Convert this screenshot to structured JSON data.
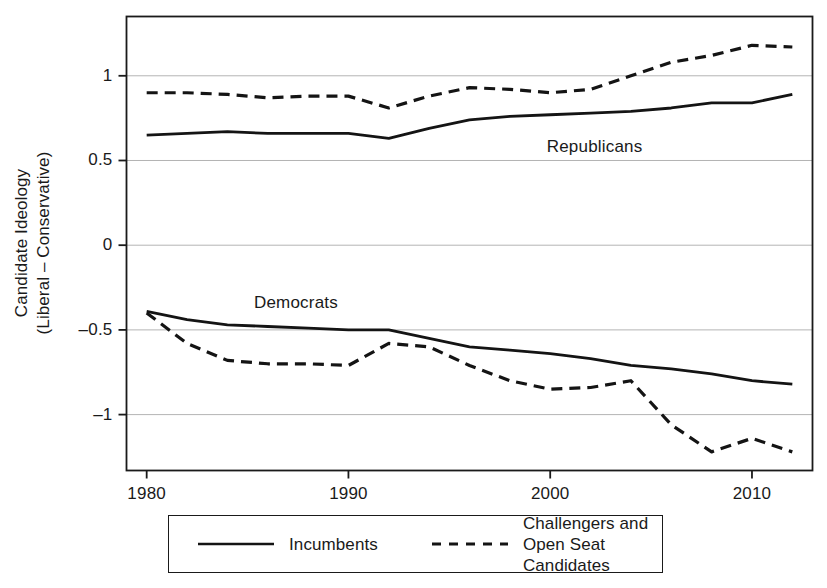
{
  "chart_data": {
    "type": "line",
    "title": "",
    "xlabel": "",
    "ylabel": "Candidate Ideology\n(Liberal – Conservative)",
    "ylabel_line1": "Candidate Ideology",
    "ylabel_line2": "(Liberal – Conservative)",
    "xlim": [
      1979,
      2013
    ],
    "ylim": [
      -1.33,
      1.35
    ],
    "grid": true,
    "grid_axis": "y",
    "legend_position": "below-plot",
    "x": [
      1980,
      1982,
      1984,
      1986,
      1988,
      1990,
      1992,
      1994,
      1996,
      1998,
      2000,
      2002,
      2004,
      2006,
      2008,
      2010,
      2012
    ],
    "xticks": [
      1980,
      1990,
      2000,
      2010
    ],
    "xtick_labels": [
      "1980",
      "1990",
      "2000",
      "2010"
    ],
    "yticks": [
      1,
      0.5,
      0,
      -0.5,
      -1
    ],
    "ytick_labels": [
      "1",
      "0.5",
      "0",
      "-0.5",
      "-1"
    ],
    "annotations": [
      {
        "text": "Republicans",
        "x": 2002.2,
        "y": 0.58
      },
      {
        "text": "Democrats",
        "x": 1987.4,
        "y": -0.34
      }
    ],
    "series": [
      {
        "name": "Republican Incumbents",
        "party": "Republicans",
        "type": "Incumbents",
        "style": "solid",
        "color": "#141414",
        "values": [
          0.65,
          0.66,
          0.67,
          0.66,
          0.66,
          0.66,
          0.63,
          0.69,
          0.74,
          0.76,
          0.77,
          0.78,
          0.79,
          0.81,
          0.84,
          0.84,
          0.89
        ]
      },
      {
        "name": "Republican Challengers and Open Seat Candidates",
        "party": "Republicans",
        "type": "Challengers and Open Seat Candidates",
        "style": "dashed",
        "color": "#141414",
        "values": [
          0.9,
          0.9,
          0.89,
          0.87,
          0.88,
          0.88,
          0.81,
          0.88,
          0.93,
          0.92,
          0.9,
          0.92,
          1.0,
          1.08,
          1.12,
          1.18,
          1.17
        ]
      },
      {
        "name": "Democratic Incumbents",
        "party": "Democrats",
        "type": "Incumbents",
        "style": "solid",
        "color": "#141414",
        "values": [
          -0.39,
          -0.44,
          -0.47,
          -0.48,
          -0.49,
          -0.5,
          -0.5,
          -0.55,
          -0.6,
          -0.62,
          -0.64,
          -0.67,
          -0.71,
          -0.73,
          -0.76,
          -0.8,
          -0.82
        ]
      },
      {
        "name": "Democratic Challengers and Open Seat Candidates",
        "party": "Democrats",
        "type": "Challengers and Open Seat Candidates",
        "style": "dashed",
        "color": "#141414",
        "values": [
          -0.4,
          -0.58,
          -0.68,
          -0.7,
          -0.7,
          -0.71,
          -0.58,
          -0.6,
          -0.71,
          -0.8,
          -0.85,
          -0.84,
          -0.8,
          -1.06,
          -1.22,
          -1.14,
          -1.22
        ]
      }
    ]
  },
  "legend": {
    "entries": [
      {
        "label": "Incumbents",
        "style": "solid"
      },
      {
        "label": "Challengers and\nOpen Seat Candidates",
        "style": "dashed"
      }
    ]
  },
  "style": {
    "axis_color": "#1a1a1a",
    "grid_color": "#b4b4b4",
    "line_color": "#141414",
    "background": "#ffffff"
  }
}
